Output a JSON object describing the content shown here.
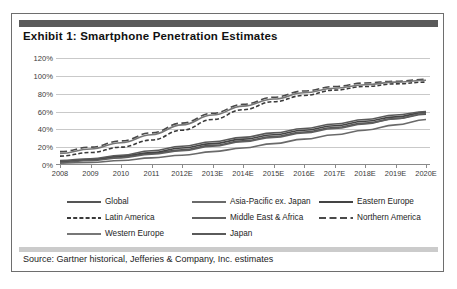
{
  "exhibit": {
    "title": "Exhibit 1: Smartphone Penetration Estimates",
    "source": "Source: Gartner historical, Jefferies & Company, Inc. estimates",
    "frame_border_color": "#6e6e6e",
    "title_rule_color": "#5a5a5a",
    "source_rule_color": "#cbcbcb",
    "gridline_color": "#c9c9c9"
  },
  "chart_data": {
    "type": "line",
    "title": "Exhibit 1: Smartphone Penetration Estimates",
    "xlabel": "",
    "ylabel": "",
    "grid": true,
    "legend_position": "bottom",
    "ylim": [
      0,
      120
    ],
    "ytick_labels": [
      "0%",
      "20%",
      "40%",
      "60%",
      "80%",
      "100%",
      "120%"
    ],
    "ytick_values": [
      0,
      20,
      40,
      60,
      80,
      100,
      120
    ],
    "categories": [
      "2008",
      "2009",
      "2010",
      "2011",
      "2012E",
      "2013E",
      "2014E",
      "2015E",
      "2016E",
      "2017E",
      "2018E",
      "2019E",
      "2020E"
    ],
    "series": [
      {
        "name": "Global",
        "style": "solid",
        "color": "#555555",
        "width": 1.6,
        "values": [
          4,
          6,
          9,
          13,
          17,
          22,
          27,
          32,
          37,
          42,
          47,
          52,
          57
        ]
      },
      {
        "name": "Asia-Pacific ex. Japan",
        "style": "solid",
        "color": "#6a6a6a",
        "width": 1.6,
        "values": [
          2,
          3,
          5,
          8,
          11,
          15,
          19,
          24,
          29,
          34,
          39,
          45,
          51
        ]
      },
      {
        "name": "Eastern Europe",
        "style": "solid",
        "color": "#444444",
        "width": 1.6,
        "values": [
          4,
          6,
          10,
          14,
          19,
          24,
          29,
          34,
          39,
          44,
          49,
          54,
          59
        ]
      },
      {
        "name": "Latin America",
        "style": "dashed-short",
        "color": "#3a3a3a",
        "width": 1.6,
        "values": [
          10,
          14,
          20,
          28,
          39,
          51,
          62,
          71,
          78,
          84,
          88,
          91,
          93
        ]
      },
      {
        "name": "Middle East & Africa",
        "style": "solid",
        "color": "#5f5f5f",
        "width": 1.6,
        "values": [
          3,
          5,
          8,
          12,
          16,
          21,
          26,
          31,
          36,
          41,
          46,
          52,
          58
        ]
      },
      {
        "name": "Northern America",
        "style": "dashed-long",
        "color": "#4a4a4a",
        "width": 1.6,
        "values": [
          15,
          20,
          27,
          36,
          47,
          58,
          68,
          76,
          83,
          88,
          92,
          94,
          96
        ]
      },
      {
        "name": "Western Europe",
        "style": "solid",
        "color": "#777777",
        "width": 1.6,
        "values": [
          13,
          18,
          25,
          34,
          45,
          56,
          66,
          74,
          81,
          86,
          90,
          93,
          95
        ]
      },
      {
        "name": "Japan",
        "style": "solid",
        "color": "#5a5a5a",
        "width": 1.6,
        "values": [
          5,
          7,
          11,
          16,
          21,
          26,
          31,
          36,
          41,
          46,
          51,
          56,
          60
        ]
      }
    ],
    "legend_rows": [
      [
        {
          "name": "Global",
          "style": "solid"
        },
        {
          "name": "Asia-Pacific ex. Japan",
          "style": "solid"
        },
        {
          "name": "Eastern Europe",
          "style": "solid"
        }
      ],
      [
        {
          "name": "Latin America",
          "style": "dashed-short"
        },
        {
          "name": "Middle East & Africa",
          "style": "solid"
        },
        {
          "name": "Northern America",
          "style": "dashed-long"
        }
      ],
      [
        {
          "name": "Western Europe",
          "style": "solid"
        },
        {
          "name": "Japan",
          "style": "solid"
        }
      ]
    ]
  }
}
